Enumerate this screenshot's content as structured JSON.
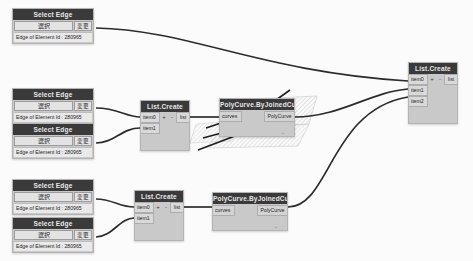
{
  "canvas": {
    "background_color": "#fbfbfb",
    "wire_color": "#2b2b2b",
    "node_body_color": "#c9c9c9",
    "node_title_color": "#3a3a3a"
  },
  "nodes": {
    "select_edge": [
      {
        "id": "select-edge-1",
        "title": "Select Edge",
        "main_button": "選択",
        "change_button": "変更",
        "caption": "Edge of Element Id : 280965",
        "x": 12,
        "y": 8
      },
      {
        "id": "select-edge-2",
        "title": "Select Edge",
        "main_button": "選択",
        "change_button": "変更",
        "caption": "Edge of Element Id : 280965",
        "x": 12,
        "y": 88
      },
      {
        "id": "select-edge-3",
        "title": "Select Edge",
        "main_button": "選択",
        "change_button": "変更",
        "caption": "Edge of Element Id : 280965",
        "x": 12,
        "y": 123
      },
      {
        "id": "select-edge-4",
        "title": "Select Edge",
        "main_button": "選択",
        "change_button": "変更",
        "caption": "Edge of Element Id : 280965",
        "x": 12,
        "y": 179
      },
      {
        "id": "select-edge-5",
        "title": "Select Edge",
        "main_button": "選択",
        "change_button": "変更",
        "caption": "Edge of Element Id : 280965",
        "x": 12,
        "y": 217
      }
    ],
    "list_create": [
      {
        "id": "list-create-mid",
        "title": "List.Create",
        "inputs": [
          "item0",
          "item1"
        ],
        "plus": "+",
        "minus": "-",
        "output": "list",
        "x": 140,
        "y": 100
      },
      {
        "id": "list-create-bottom",
        "title": "List.Create",
        "inputs": [
          "item0",
          "item1"
        ],
        "plus": "+",
        "minus": "-",
        "output": "list",
        "x": 134,
        "y": 190
      },
      {
        "id": "list-create-right",
        "title": "List.Create",
        "inputs": [
          "item0",
          "item1",
          "item2"
        ],
        "plus": "+",
        "minus": "-",
        "output": "list",
        "x": 408,
        "y": 62
      }
    ],
    "polycurve": [
      {
        "id": "polycurve-mid",
        "title": "PolyCurve.ByJoinedCurves",
        "input": "curves",
        "output": "PolyCurve",
        "tail_mark": "⌄",
        "x": 219,
        "y": 98
      },
      {
        "id": "polycurve-bottom",
        "title": "PolyCurve.ByJoinedCurves",
        "input": "curves",
        "output": "PolyCurve",
        "tail_mark": "⌄",
        "x": 212,
        "y": 192
      }
    ]
  }
}
